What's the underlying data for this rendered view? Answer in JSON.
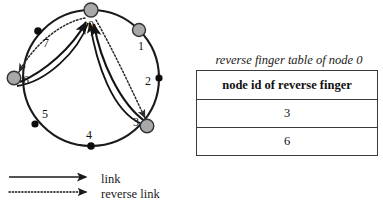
{
  "figure": {
    "ring": {
      "title": "",
      "nodes": [
        {
          "id": "0",
          "label": "0",
          "kind": "active",
          "angle_deg": -90,
          "label_dx": 0,
          "label_dy": 17
        },
        {
          "id": "1",
          "label": "1",
          "kind": "active",
          "angle_deg": -45,
          "label_dx": 1,
          "label_dy": 18
        },
        {
          "id": "2",
          "label": "2",
          "kind": "slot",
          "angle_deg": 0,
          "label_dx": -12,
          "label_dy": 5
        },
        {
          "id": "3",
          "label": "3",
          "kind": "active",
          "angle_deg": 45,
          "label_dx": -12,
          "label_dy": -2
        },
        {
          "id": "4",
          "label": "4",
          "kind": "slot",
          "angle_deg": 90,
          "label_dx": -1,
          "label_dy": -8
        },
        {
          "id": "5",
          "label": "5",
          "kind": "slot",
          "angle_deg": 135,
          "label_dx": 10,
          "label_dy": -7
        },
        {
          "id": "6",
          "label": "6",
          "kind": "active",
          "angle_deg": 180,
          "label_dx": 12,
          "label_dy": 6
        },
        {
          "id": "7",
          "label": "7",
          "kind": "slot",
          "angle_deg": -135,
          "label_dx": 8,
          "label_dy": 16
        }
      ],
      "links": [
        {
          "from": "3",
          "to": "0",
          "type": "link"
        },
        {
          "from": "6",
          "to": "0",
          "type": "link"
        },
        {
          "from": "0",
          "to": "3",
          "type": "reverse link"
        },
        {
          "from": "0",
          "to": "6",
          "type": "reverse link"
        }
      ],
      "colors": {
        "ring_stroke": "#1a1a1a",
        "active_node_fill": "#a8a8a8",
        "active_node_stroke": "#333333",
        "slot_node_fill": "#0d0d0d",
        "link_stroke": "#141414",
        "reverse_link_stroke": "#2a2a2a"
      }
    },
    "legend": {
      "items": [
        {
          "label": "link",
          "style": "solid"
        },
        {
          "label": "reverse link",
          "style": "dotted"
        }
      ]
    }
  },
  "table": {
    "caption": "reverse finger table of node 0",
    "header": "node id of reverse finger",
    "rows": [
      "3",
      "6"
    ]
  }
}
